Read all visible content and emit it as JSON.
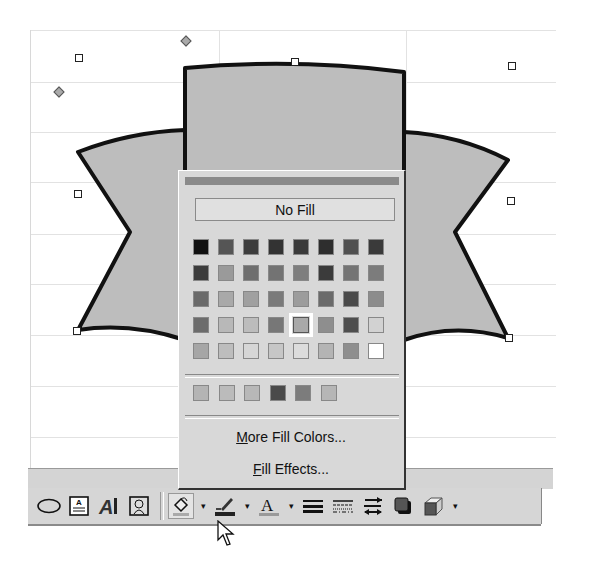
{
  "fill_color_menu": {
    "no_fill_label": "No Fill",
    "palette": [
      [
        "#111111",
        "#555555",
        "#3d3d3d",
        "#333333",
        "#3a3a3a",
        "#2e2e2e",
        "#505050",
        "#3a3a3a"
      ],
      [
        "#3c3c3c",
        "#9a9a9a",
        "#6e6e6e",
        "#737373",
        "#7e7e7e",
        "#3b3b3b",
        "#747474",
        "#7c7c7c"
      ],
      [
        "#6a6a6a",
        "#a9a9a9",
        "#a0a0a0",
        "#7a7a7a",
        "#9c9c9c",
        "#6a6a6a",
        "#4a4a4a",
        "#8c8c8c"
      ],
      [
        "#6c6c6c",
        "#b8b8b8",
        "#bcbcbc",
        "#777777",
        "#a9a9a9",
        "#8e8e8e",
        "#4e4e4e",
        "#d2d2d2"
      ],
      [
        "#a6a6a6",
        "#bdbdbd",
        "#d6d6d6",
        "#c6c6c6",
        "#dcdcdc",
        "#b4b4b4",
        "#8e8e8e",
        "#ffffff"
      ]
    ],
    "selected_swatch": {
      "row": 3,
      "col": 4
    },
    "recent_colors": [
      "#b4b4b4",
      "#bbbbbb",
      "#b8b8b8",
      "#4a4a4a",
      "#7c7c7c",
      "#b6b6b6"
    ],
    "more_colors_label": "More Fill Colors...",
    "more_colors_mnemonic": "M",
    "more_colors_rest": "ore Fill Colors...",
    "fill_effects_label": "Fill Effects...",
    "fill_effects_mnemonic": "F",
    "fill_effects_rest": "ill Effects..."
  },
  "drawing_toolbar": {
    "buttons": [
      {
        "name": "oval",
        "icon": "oval-icon"
      },
      {
        "name": "text-box",
        "icon": "text-box-icon"
      },
      {
        "name": "wordart",
        "icon": "wordart-icon"
      },
      {
        "name": "clip-art",
        "icon": "clip-art-icon"
      },
      {
        "name": "fill-color",
        "icon": "paint-bucket-icon",
        "pressed": true
      },
      {
        "name": "line-color",
        "icon": "pen-icon"
      },
      {
        "name": "font-color",
        "icon": "font-color-icon",
        "glyph": "A"
      },
      {
        "name": "line-style",
        "icon": "line-style-icon"
      },
      {
        "name": "dash-style",
        "icon": "dash-style-icon"
      },
      {
        "name": "arrow-style",
        "icon": "arrow-style-icon"
      },
      {
        "name": "shadow",
        "icon": "shadow-icon"
      },
      {
        "name": "3d",
        "icon": "3d-icon"
      }
    ],
    "dropdown_glyph": "▾"
  },
  "shape": {
    "type": "ribbon-autoshape",
    "fill": "#bdbdbd",
    "outline": "#111111"
  }
}
